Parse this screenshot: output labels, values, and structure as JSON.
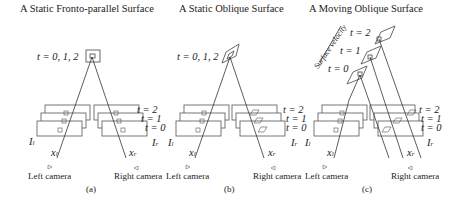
{
  "figure": {
    "panels": [
      {
        "id": "a",
        "title": "A Static Fronto-parallel Surface",
        "time_label": "t = 0, 1, 2",
        "frame_labels": [
          "t = 2",
          "t = 1",
          "t = 0"
        ],
        "left_image": "I",
        "left_image_sub": "l",
        "right_image": "I",
        "right_image_sub": "r",
        "left_point": "x",
        "left_point_sub": "l",
        "right_point": "x",
        "right_point_sub": "r",
        "left_camera": "Left camera",
        "right_camera": "Right camera",
        "caption": "(a)"
      },
      {
        "id": "b",
        "title": "A Static Oblique Surface",
        "time_label": "t = 0, 1, 2",
        "frame_labels": [
          "t = 2",
          "t = 1",
          "t = 0"
        ],
        "left_image": "I",
        "left_image_sub": "l",
        "right_image": "I",
        "right_image_sub": "r",
        "left_point": "x",
        "left_point_sub": "l",
        "right_point": "x",
        "right_point_sub": "r",
        "left_camera": "Left camera",
        "right_camera": "Right camera",
        "caption": "(b)"
      },
      {
        "id": "c",
        "title": "A Moving Oblique Surface",
        "surface_velocity_label": "Surface velocity",
        "surface_time_labels": [
          "t = 2",
          "t = 1",
          "t = 0"
        ],
        "frame_labels": [
          "t = 2",
          "t = 1",
          "t = 0"
        ],
        "left_image": "I",
        "left_image_sub": "l",
        "right_image": "I",
        "right_image_sub": "r",
        "left_point": "x",
        "left_point_sub": "l",
        "right_point": "x",
        "right_point_sub": "r",
        "left_camera": "Left camera",
        "right_camera": "Right camera",
        "caption": "(c)"
      }
    ],
    "colors": {
      "line": "#333333",
      "frame": "#555555",
      "bg": "#ffffff"
    }
  }
}
